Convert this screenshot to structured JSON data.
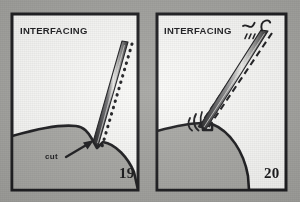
{
  "figure": {
    "kind": "sewing-instruction-illustration",
    "background_color": "#a3a39f",
    "ink_color": "#161618",
    "paper_color": "#fbfbf9",
    "fabric_color": "#a8a8a4",
    "panel_count": 2
  },
  "panels": [
    {
      "id": "panel-left",
      "number": "19",
      "interfacing_label": "INTERFACING",
      "cut_label": "cut",
      "annotations": [
        "INTERFACING",
        "cut",
        "19"
      ],
      "stitch_line_style": "dotted",
      "tool": "needle-point",
      "notch": "v-notch-clip"
    },
    {
      "id": "panel-right",
      "number": "20",
      "interfacing_label": "INTERFACING",
      "annotations": [
        "INTERFACING",
        "20"
      ],
      "stitch_line_style": "dashed",
      "tool": "needle-point",
      "notch": "squared-clip"
    }
  ]
}
